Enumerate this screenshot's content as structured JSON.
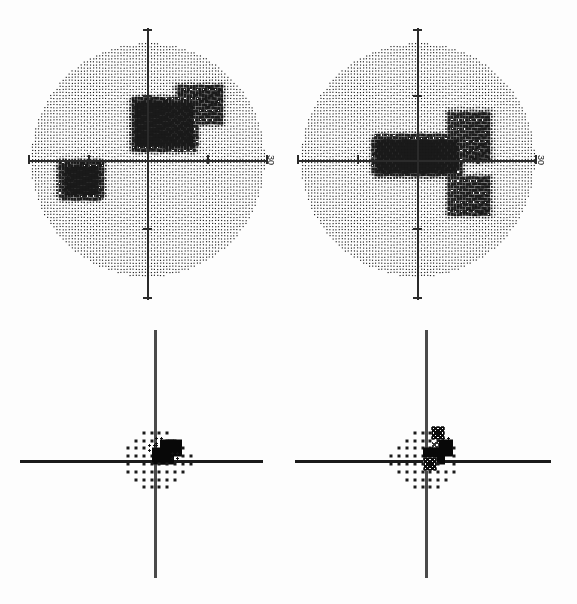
{
  "document": {
    "kind": "visual-field-perimetry-printout",
    "panel_count": 4
  },
  "axis": {
    "label_30": "30"
  },
  "panels": [
    {
      "id": "grayscale-left",
      "type": "grayscale",
      "eye_note": "",
      "axis_label": "30"
    },
    {
      "id": "grayscale-right",
      "type": "grayscale",
      "eye_note": "",
      "axis_label": "30"
    },
    {
      "id": "probability-left",
      "type": "probability",
      "axis_label": ""
    },
    {
      "id": "probability-right",
      "type": "probability",
      "axis_label": ""
    }
  ],
  "legend_levels": {
    "0": "normal-dot",
    "1": "p<5-cluster",
    "2": "p<2-hatch",
    "3": "p<1-dense-hatch",
    "4": "p<0.5-solid"
  },
  "chart_data": [
    {
      "type": "heatmap",
      "name": "grayscale-left",
      "title": "",
      "xlabel": "",
      "ylabel": "",
      "xlim": [
        -30,
        30
      ],
      "ylim": [
        -30,
        30
      ],
      "xticks": [
        -30,
        -15,
        0,
        15,
        30
      ],
      "yticks": [
        -30,
        -15,
        0,
        15,
        30
      ],
      "grid": false,
      "legend": "none",
      "description": "Stippled grayscale field with dense dark defect superior-nasal to fixation and a second dark patch inferior-temporal left of vertical midline.",
      "dark_regions": [
        {
          "x": 4,
          "y": 9,
          "w": 14,
          "h": 11,
          "density": "black"
        },
        {
          "x": 13,
          "y": 14,
          "w": 11,
          "h": 9,
          "density": "dark"
        },
        {
          "x": -17,
          "y": -5,
          "w": 9,
          "h": 7,
          "density": "black"
        }
      ]
    },
    {
      "type": "heatmap",
      "name": "grayscale-right",
      "title": "",
      "xlabel": "",
      "ylabel": "",
      "xlim": [
        -30,
        30
      ],
      "ylim": [
        -30,
        30
      ],
      "xticks": [
        -30,
        -15,
        0,
        15,
        30
      ],
      "yticks": [
        -30,
        -15,
        0,
        15,
        30
      ],
      "grid": false,
      "legend": "none",
      "description": "Stippled grayscale field with a dense black horizontal band immediately above the horizontal meridian extending from fixation temporally, plus a dark blob below the meridian.",
      "dark_regions": [
        {
          "x": 0,
          "y": 1,
          "w": 20,
          "h": 8,
          "density": "black"
        },
        {
          "x": 13,
          "y": 6,
          "w": 10,
          "h": 12,
          "density": "dark"
        },
        {
          "x": 13,
          "y": -9,
          "w": 10,
          "h": 9,
          "density": "dark"
        }
      ]
    },
    {
      "type": "scatter",
      "name": "probability-left",
      "title": "",
      "xlabel": "",
      "ylabel": "",
      "xlim": [
        -27,
        27
      ],
      "ylim": [
        -27,
        27
      ],
      "xticks": [],
      "yticks": [],
      "grid": false,
      "legend": "none",
      "description": "24-2 pattern deviation probability plot, left panel. Levels: 0 normal dot, 1 cluster, 2 hatch, 3 dense hatch, 4 solid.",
      "points": [
        {
          "x": -9,
          "y": 21,
          "level": 0
        },
        {
          "x": -3,
          "y": 21,
          "level": 0
        },
        {
          "x": 3,
          "y": 21,
          "level": 0
        },
        {
          "x": 9,
          "y": 21,
          "level": 0
        },
        {
          "x": -15,
          "y": 15,
          "level": 0
        },
        {
          "x": -9,
          "y": 15,
          "level": 0
        },
        {
          "x": -3,
          "y": 15,
          "level": 0
        },
        {
          "x": 3,
          "y": 15,
          "level": 1
        },
        {
          "x": 9,
          "y": 15,
          "level": 0
        },
        {
          "x": 15,
          "y": 15,
          "level": 0
        },
        {
          "x": -21,
          "y": 9,
          "level": 0
        },
        {
          "x": -15,
          "y": 9,
          "level": 0
        },
        {
          "x": -9,
          "y": 9,
          "level": 0
        },
        {
          "x": -3,
          "y": 9,
          "level": 1
        },
        {
          "x": 3,
          "y": 9,
          "level": 1
        },
        {
          "x": 9,
          "y": 9,
          "level": 4
        },
        {
          "x": 15,
          "y": 9,
          "level": 4
        },
        {
          "x": 21,
          "y": 9,
          "level": 0
        },
        {
          "x": -21,
          "y": 3,
          "level": 0
        },
        {
          "x": -15,
          "y": 3,
          "level": 0
        },
        {
          "x": -9,
          "y": 3,
          "level": 0
        },
        {
          "x": -3,
          "y": 3,
          "level": 0
        },
        {
          "x": 3,
          "y": 3,
          "level": 4
        },
        {
          "x": 9,
          "y": 3,
          "level": 4
        },
        {
          "x": 15,
          "y": 3,
          "level": 1
        },
        {
          "x": 21,
          "y": 3,
          "level": 0
        },
        {
          "x": 27,
          "y": 3,
          "level": 0
        },
        {
          "x": -21,
          "y": -3,
          "level": 0
        },
        {
          "x": -9,
          "y": -3,
          "level": 0
        },
        {
          "x": -3,
          "y": -3,
          "level": 0
        },
        {
          "x": 3,
          "y": -3,
          "level": 0
        },
        {
          "x": 9,
          "y": -3,
          "level": 0
        },
        {
          "x": 15,
          "y": -3,
          "level": 0
        },
        {
          "x": 21,
          "y": -3,
          "level": 0
        },
        {
          "x": 27,
          "y": -3,
          "level": 0
        },
        {
          "x": -21,
          "y": -9,
          "level": 0
        },
        {
          "x": -15,
          "y": -9,
          "level": 0
        },
        {
          "x": -9,
          "y": -9,
          "level": 0
        },
        {
          "x": -3,
          "y": -9,
          "level": 0
        },
        {
          "x": 3,
          "y": -9,
          "level": 0
        },
        {
          "x": 9,
          "y": -9,
          "level": 0
        },
        {
          "x": 15,
          "y": -9,
          "level": 0
        },
        {
          "x": 21,
          "y": -9,
          "level": 0
        },
        {
          "x": -15,
          "y": -15,
          "level": 0
        },
        {
          "x": -9,
          "y": -15,
          "level": 0
        },
        {
          "x": -3,
          "y": -15,
          "level": 0
        },
        {
          "x": 3,
          "y": -15,
          "level": 0
        },
        {
          "x": 9,
          "y": -15,
          "level": 0
        },
        {
          "x": 15,
          "y": -15,
          "level": 0
        },
        {
          "x": -9,
          "y": -21,
          "level": 0
        },
        {
          "x": -3,
          "y": -21,
          "level": 0
        },
        {
          "x": 3,
          "y": -21,
          "level": 0
        },
        {
          "x": 9,
          "y": -21,
          "level": 0
        }
      ]
    },
    {
      "type": "scatter",
      "name": "probability-right",
      "title": "",
      "xlabel": "",
      "ylabel": "",
      "xlim": [
        -27,
        27
      ],
      "ylim": [
        -27,
        27
      ],
      "xticks": [],
      "yticks": [],
      "grid": false,
      "legend": "none",
      "description": "24-2 pattern deviation probability plot, right panel, showing a dense cluster of abnormal points just temporal and superior to fixation.",
      "points": [
        {
          "x": -9,
          "y": 21,
          "level": 0
        },
        {
          "x": -3,
          "y": 21,
          "level": 0
        },
        {
          "x": 3,
          "y": 21,
          "level": 0
        },
        {
          "x": 9,
          "y": 21,
          "level": 3
        },
        {
          "x": -15,
          "y": 15,
          "level": 0
        },
        {
          "x": -9,
          "y": 15,
          "level": 0
        },
        {
          "x": -3,
          "y": 15,
          "level": 0
        },
        {
          "x": 3,
          "y": 15,
          "level": 0
        },
        {
          "x": 9,
          "y": 15,
          "level": 0
        },
        {
          "x": 15,
          "y": 15,
          "level": 1
        },
        {
          "x": -21,
          "y": 9,
          "level": 0
        },
        {
          "x": -15,
          "y": 9,
          "level": 0
        },
        {
          "x": -9,
          "y": 9,
          "level": 0
        },
        {
          "x": -3,
          "y": 9,
          "level": 0
        },
        {
          "x": 3,
          "y": 9,
          "level": 0
        },
        {
          "x": 9,
          "y": 9,
          "level": 2
        },
        {
          "x": 15,
          "y": 9,
          "level": 4
        },
        {
          "x": 21,
          "y": 9,
          "level": 0
        },
        {
          "x": -27,
          "y": 3,
          "level": 0
        },
        {
          "x": -21,
          "y": 3,
          "level": 0
        },
        {
          "x": -15,
          "y": 3,
          "level": 0
        },
        {
          "x": -9,
          "y": 3,
          "level": 0
        },
        {
          "x": -3,
          "y": 3,
          "level": 0
        },
        {
          "x": 3,
          "y": 3,
          "level": 4
        },
        {
          "x": 9,
          "y": 3,
          "level": 4
        },
        {
          "x": 21,
          "y": 3,
          "level": 0
        },
        {
          "x": -27,
          "y": -3,
          "level": 0
        },
        {
          "x": -21,
          "y": -3,
          "level": 0
        },
        {
          "x": -15,
          "y": -3,
          "level": 0
        },
        {
          "x": -9,
          "y": -3,
          "level": 0
        },
        {
          "x": -3,
          "y": -3,
          "level": 0
        },
        {
          "x": 3,
          "y": -3,
          "level": 3
        },
        {
          "x": 9,
          "y": -3,
          "level": 0
        },
        {
          "x": 21,
          "y": -3,
          "level": 0
        },
        {
          "x": -21,
          "y": -9,
          "level": 0
        },
        {
          "x": -15,
          "y": -9,
          "level": 0
        },
        {
          "x": -9,
          "y": -9,
          "level": 0
        },
        {
          "x": -3,
          "y": -9,
          "level": 0
        },
        {
          "x": 3,
          "y": -9,
          "level": 0
        },
        {
          "x": 9,
          "y": -9,
          "level": 0
        },
        {
          "x": 15,
          "y": -9,
          "level": 0
        },
        {
          "x": 21,
          "y": -9,
          "level": 0
        },
        {
          "x": -15,
          "y": -15,
          "level": 0
        },
        {
          "x": -9,
          "y": -15,
          "level": 0
        },
        {
          "x": -3,
          "y": -15,
          "level": 0
        },
        {
          "x": 3,
          "y": -15,
          "level": 0
        },
        {
          "x": 9,
          "y": -15,
          "level": 0
        },
        {
          "x": 15,
          "y": -15,
          "level": 0
        },
        {
          "x": -9,
          "y": -21,
          "level": 0
        },
        {
          "x": -3,
          "y": -21,
          "level": 0
        },
        {
          "x": 3,
          "y": -21,
          "level": 0
        },
        {
          "x": 9,
          "y": -21,
          "level": 0
        }
      ]
    }
  ]
}
